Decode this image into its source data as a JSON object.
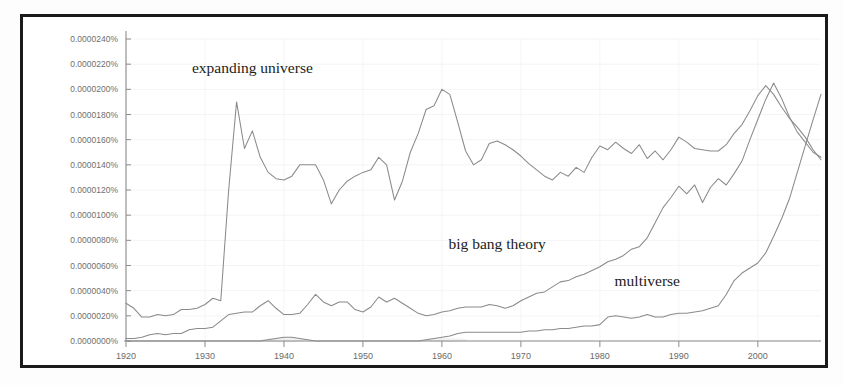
{
  "chart_data": {
    "type": "line",
    "title": "",
    "xlabel": "",
    "ylabel": "",
    "xlim": [
      1920,
      2008
    ],
    "ylim": [
      0.0,
      2.4e-05
    ],
    "grid": true,
    "legend_position": "inline-annotations",
    "ytick_labels": [
      "0.0000240%",
      "0.0000220%",
      "0.0000200%",
      "0.0000180%",
      "0.0000160%",
      "0.0000140%",
      "0.0000120%",
      "0.0000100%",
      "0.0000080%",
      "0.0000060%",
      "0.0000040%",
      "0.0000020%",
      "0.0000000%"
    ],
    "ytick_values": [
      2.4e-05,
      2.2e-05,
      2e-05,
      1.8e-05,
      1.6e-05,
      1.4e-05,
      1.2e-05,
      1e-05,
      8e-06,
      6e-06,
      4e-06,
      2e-06,
      0.0
    ],
    "xtick_labels": [
      "1920",
      "1930",
      "1940",
      "1950",
      "1960",
      "1970",
      "1980",
      "1990",
      "2000"
    ],
    "xtick_values": [
      1920,
      1930,
      1940,
      1950,
      1960,
      1970,
      1980,
      1990,
      2000
    ],
    "x": [
      1920,
      1921,
      1922,
      1923,
      1924,
      1925,
      1926,
      1927,
      1928,
      1929,
      1930,
      1931,
      1932,
      1933,
      1934,
      1935,
      1936,
      1937,
      1938,
      1939,
      1940,
      1941,
      1942,
      1943,
      1944,
      1945,
      1946,
      1947,
      1948,
      1949,
      1950,
      1951,
      1952,
      1953,
      1954,
      1955,
      1956,
      1957,
      1958,
      1959,
      1960,
      1961,
      1962,
      1963,
      1964,
      1965,
      1966,
      1967,
      1968,
      1969,
      1970,
      1971,
      1972,
      1973,
      1974,
      1975,
      1976,
      1977,
      1978,
      1979,
      1980,
      1981,
      1982,
      1983,
      1984,
      1985,
      1986,
      1987,
      1988,
      1989,
      1990,
      1991,
      1992,
      1993,
      1994,
      1995,
      1996,
      1997,
      1998,
      1999,
      2000,
      2001,
      2002,
      2003,
      2004,
      2005,
      2006,
      2007,
      2008
    ],
    "series": [
      {
        "name": "expanding universe",
        "color": "#8a8a8a",
        "label_x": 1936,
        "label_y": 2.13e-05,
        "values": [
          3e-06,
          2.6e-06,
          1.9e-06,
          1.9e-06,
          2.1e-06,
          2e-06,
          2.1e-06,
          2.5e-06,
          2.5e-06,
          2.6e-06,
          2.9e-06,
          3.4e-06,
          3.2e-06,
          1.2e-05,
          1.9e-05,
          1.53e-05,
          1.67e-05,
          1.46e-05,
          1.34e-05,
          1.29e-05,
          1.28e-05,
          1.31e-05,
          1.4e-05,
          1.4e-05,
          1.4e-05,
          1.28e-05,
          1.09e-05,
          1.2e-05,
          1.27e-05,
          1.31e-05,
          1.34e-05,
          1.36e-05,
          1.46e-05,
          1.4e-05,
          1.12e-05,
          1.27e-05,
          1.5e-05,
          1.65e-05,
          1.84e-05,
          1.87e-05,
          2e-05,
          1.96e-05,
          1.74e-05,
          1.51e-05,
          1.4e-05,
          1.44e-05,
          1.57e-05,
          1.59e-05,
          1.56e-05,
          1.52e-05,
          1.47e-05,
          1.41e-05,
          1.36e-05,
          1.31e-05,
          1.28e-05,
          1.34e-05,
          1.31e-05,
          1.38e-05,
          1.34e-05,
          1.46e-05,
          1.55e-05,
          1.52e-05,
          1.58e-05,
          1.53e-05,
          1.49e-05,
          1.56e-05,
          1.45e-05,
          1.51e-05,
          1.44e-05,
          1.52e-05,
          1.62e-05,
          1.58e-05,
          1.53e-05,
          1.52e-05,
          1.51e-05,
          1.51e-05,
          1.56e-05,
          1.65e-05,
          1.72e-05,
          1.83e-05,
          1.95e-05,
          2.03e-05,
          1.96e-05,
          1.86e-05,
          1.77e-05,
          1.7e-05,
          1.62e-05,
          1.52e-05,
          1.44e-05
        ]
      },
      {
        "name": "big bang theory",
        "color": "#8f8f8f",
        "label_x": 1967,
        "label_y": 7.3e-06,
        "values": [
          2e-07,
          2e-07,
          3e-07,
          5e-07,
          6e-07,
          5e-07,
          6e-07,
          6e-07,
          9e-07,
          1e-06,
          1e-06,
          1.1e-06,
          1.6e-06,
          2.1e-06,
          2.2e-06,
          2.3e-06,
          2.3e-06,
          2.8e-06,
          3.2e-06,
          2.6e-06,
          2.1e-06,
          2.1e-06,
          2.2e-06,
          2.9e-06,
          3.7e-06,
          3.1e-06,
          2.8e-06,
          3.1e-06,
          3.1e-06,
          2.5e-06,
          2.3e-06,
          2.7e-06,
          3.5e-06,
          3.1e-06,
          3.4e-06,
          3e-06,
          2.6e-06,
          2.2e-06,
          2e-06,
          2.1e-06,
          2.3e-06,
          2.4e-06,
          2.6e-06,
          2.7e-06,
          2.7e-06,
          2.7e-06,
          2.9e-06,
          2.8e-06,
          2.6e-06,
          2.8e-06,
          3.2e-06,
          3.5e-06,
          3.8e-06,
          3.9e-06,
          4.3e-06,
          4.7e-06,
          4.8e-06,
          5.1e-06,
          5.3e-06,
          5.6e-06,
          5.9e-06,
          6.3e-06,
          6.5e-06,
          6.8e-06,
          7.3e-06,
          7.5e-06,
          8.2e-06,
          9.4e-06,
          1.06e-05,
          1.14e-05,
          1.23e-05,
          1.17e-05,
          1.24e-05,
          1.1e-05,
          1.22e-05,
          1.29e-05,
          1.24e-05,
          1.33e-05,
          1.43e-05,
          1.6e-05,
          1.76e-05,
          1.92e-05,
          2.05e-05,
          1.93e-05,
          1.78e-05,
          1.66e-05,
          1.58e-05,
          1.5e-05,
          1.46e-05
        ]
      },
      {
        "name": "multiverse",
        "color": "#9a9a9a",
        "label_x": 1986,
        "label_y": 4.4e-06,
        "values": [
          0.0,
          0.0,
          0.0,
          0.0,
          0.0,
          0.0,
          0.0,
          0.0,
          0.0,
          0.0,
          0.0,
          0.0,
          0.0,
          0.0,
          0.0,
          0.0,
          0.0,
          0.0,
          1e-07,
          2e-07,
          3e-07,
          3e-07,
          2e-07,
          1e-07,
          0.0,
          0.0,
          0.0,
          0.0,
          0.0,
          0.0,
          0.0,
          0.0,
          0.0,
          0.0,
          0.0,
          0.0,
          0.0,
          0.0,
          1e-07,
          2e-07,
          3e-07,
          4e-07,
          6e-07,
          7e-07,
          7e-07,
          7e-07,
          7e-07,
          7e-07,
          7e-07,
          7e-07,
          7e-07,
          8e-07,
          8e-07,
          9e-07,
          9e-07,
          1e-06,
          1e-06,
          1.1e-06,
          1.2e-06,
          1.2e-06,
          1.3e-06,
          1.9e-06,
          2e-06,
          1.9e-06,
          1.8e-06,
          1.9e-06,
          2.1e-06,
          1.9e-06,
          1.9e-06,
          2.1e-06,
          2.2e-06,
          2.2e-06,
          2.3e-06,
          2.4e-06,
          2.6e-06,
          2.8e-06,
          3.7e-06,
          4.8e-06,
          5.4e-06,
          5.8e-06,
          6.2e-06,
          7e-06,
          8.3e-06,
          9.7e-06,
          1.13e-05,
          1.34e-05,
          1.55e-05,
          1.76e-05,
          1.96e-05
        ]
      }
    ]
  }
}
